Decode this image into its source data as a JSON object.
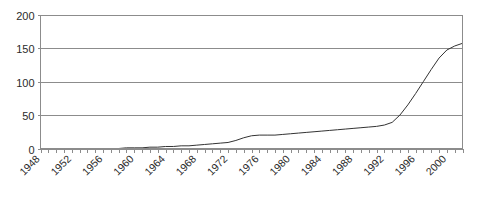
{
  "chart_data": {
    "type": "line",
    "title": "",
    "xlabel": "",
    "ylabel": "",
    "xlim": [
      1948,
      2002
    ],
    "ylim": [
      0,
      200
    ],
    "grid": true,
    "legend": false,
    "y_ticks": [
      0,
      50,
      100,
      150,
      200
    ],
    "x_tick_labels": [
      "1948",
      "1952",
      "1956",
      "1960",
      "1964",
      "1968",
      "1972",
      "1976",
      "1980",
      "1984",
      "1988",
      "1992",
      "1996",
      "2000"
    ],
    "x_tick_label_years": [
      1948,
      1952,
      1956,
      1960,
      1964,
      1968,
      1972,
      1976,
      1980,
      1984,
      1988,
      1992,
      1996,
      2000
    ],
    "x_minor_tick_interval": 1,
    "x_label_rotation_deg": -45,
    "line_color": "#333333",
    "grid_color": "#8c8c8c",
    "axis_color": "#8c8c8c",
    "background_color": "#ffffff",
    "series": [
      {
        "name": "series-1",
        "x": [
          1948,
          1949,
          1950,
          1951,
          1952,
          1953,
          1954,
          1955,
          1956,
          1957,
          1958,
          1959,
          1960,
          1961,
          1962,
          1963,
          1964,
          1965,
          1966,
          1967,
          1968,
          1969,
          1970,
          1971,
          1972,
          1973,
          1974,
          1975,
          1976,
          1977,
          1978,
          1979,
          1980,
          1981,
          1982,
          1983,
          1984,
          1985,
          1986,
          1987,
          1988,
          1989,
          1990,
          1991,
          1992,
          1993,
          1994,
          1995,
          1996,
          1997,
          1998,
          1999,
          2000,
          2001,
          2002
        ],
        "values": [
          0,
          0,
          0,
          0,
          0,
          0,
          0,
          0,
          0,
          0,
          0,
          1,
          1,
          1,
          2,
          2,
          3,
          3,
          4,
          4,
          5,
          6,
          7,
          8,
          9,
          12,
          16,
          19,
          20,
          20,
          20,
          21,
          22,
          23,
          24,
          25,
          26,
          27,
          28,
          29,
          30,
          31,
          32,
          33,
          35,
          39,
          50,
          65,
          82,
          100,
          118,
          135,
          147,
          153,
          157
        ]
      }
    ]
  },
  "axis": {
    "y_tick_labels": [
      "200",
      "150",
      "100",
      "50",
      "0"
    ]
  }
}
